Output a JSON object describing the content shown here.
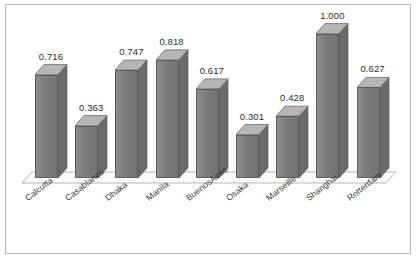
{
  "chart_data": {
    "type": "bar",
    "title": "",
    "subtitle": "",
    "xlabel": "",
    "ylabel": "",
    "ylim": [
      0,
      1.08
    ],
    "grid": false,
    "legend": null,
    "style": "3d-grayscale-column",
    "categories": [
      "Calcutta",
      "Casablanca",
      "Dhaka",
      "Manila",
      "BuenosAires",
      "Osaka",
      "Marseille",
      "Shanghai",
      "Rotterdam"
    ],
    "values": [
      0.716,
      0.363,
      0.747,
      0.818,
      0.617,
      0.301,
      0.428,
      1.0,
      0.627
    ],
    "data_labels": [
      "0.716",
      "0.363",
      "0.747",
      "0.818",
      "0.617",
      "0.301",
      "0.428",
      "1.000",
      "0.627"
    ],
    "colors": {
      "bar_front": "#7d7d7d",
      "bar_top": "#b6b6b6",
      "bar_side": "#6b6b6b",
      "bar_outline": "#5e5e5e",
      "floor": "#fbfbfb",
      "floor_edge": "#a8a8a8",
      "border": "#b9b9b9",
      "background": "#ffffff",
      "label_text": "#2b2b2b"
    }
  }
}
